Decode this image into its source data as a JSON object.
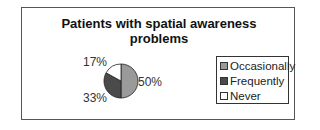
{
  "chart_data": {
    "type": "pie",
    "title": "Patients with spatial awareness problems",
    "title_lines": [
      "Patients with spatial awareness",
      "problems"
    ],
    "categories": [
      "Occasionally",
      "Frequently",
      "Never"
    ],
    "values": [
      50,
      33,
      17
    ],
    "labels": [
      "50%",
      "33%",
      "17%"
    ],
    "colors": [
      "#9a9a9a",
      "#4a4a4a",
      "#ffffff"
    ],
    "legend_position": "right"
  }
}
